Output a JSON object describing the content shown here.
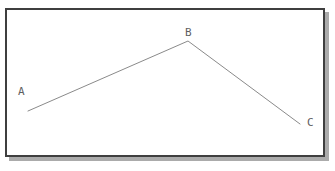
{
  "diagram": {
    "background_color": "#ffffff",
    "frame": {
      "border_color": "#3f3f3f",
      "shadow_color": "#ababab",
      "fill_color": "#ffffff"
    },
    "line_color": "#8a8a8a",
    "label_color": "#5f5f5f",
    "points": [
      {
        "label": "A",
        "x": 28,
        "y": 111,
        "label_x": 18,
        "label_y": 86
      },
      {
        "label": "B",
        "x": 188,
        "y": 41,
        "label_x": 185,
        "label_y": 27
      },
      {
        "label": "C",
        "x": 300,
        "y": 124,
        "label_x": 307,
        "label_y": 117
      }
    ],
    "segments": [
      [
        "A",
        "B"
      ],
      [
        "B",
        "C"
      ]
    ]
  }
}
